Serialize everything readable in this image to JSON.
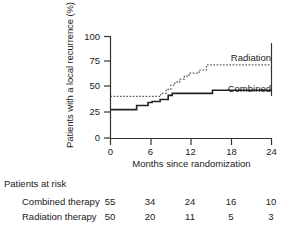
{
  "chart_data": {
    "type": "line",
    "subtype": "kaplan-meier-step",
    "title": "",
    "xlabel": "Months since randomization",
    "ylabel": "Patients with a local recurrence (%)",
    "xlim": [
      0,
      24
    ],
    "ylim": [
      0,
      100
    ],
    "xticks": [
      0,
      6,
      12,
      18,
      24
    ],
    "yticks": [
      0,
      25,
      50,
      75,
      100
    ],
    "xtick_labels": [
      "0",
      "6",
      "12",
      "18",
      "24"
    ],
    "ytick_labels": [
      "0",
      "25",
      "50",
      "75",
      "100"
    ],
    "grid": false,
    "legend_position": "inline-right",
    "series": [
      {
        "name": "Radiation",
        "label": "Radiation",
        "style": "dotted",
        "color": "#555555",
        "points": [
          [
            0,
            41
          ],
          [
            7.5,
            41
          ],
          [
            7.5,
            44
          ],
          [
            8.3,
            44
          ],
          [
            8.3,
            48
          ],
          [
            9.0,
            48
          ],
          [
            9.0,
            52
          ],
          [
            9.6,
            52
          ],
          [
            9.6,
            55
          ],
          [
            10.3,
            55
          ],
          [
            10.3,
            58
          ],
          [
            11.0,
            58
          ],
          [
            11.0,
            61
          ],
          [
            11.7,
            61
          ],
          [
            11.7,
            64
          ],
          [
            13.2,
            64
          ],
          [
            13.2,
            67
          ],
          [
            14.3,
            67
          ],
          [
            14.3,
            72
          ],
          [
            24,
            72
          ]
        ]
      },
      {
        "name": "Combined",
        "label": "Combined",
        "style": "solid",
        "color": "#222222",
        "points": [
          [
            0,
            28
          ],
          [
            3.9,
            28
          ],
          [
            3.9,
            32
          ],
          [
            5.6,
            32
          ],
          [
            5.6,
            35
          ],
          [
            6.2,
            35
          ],
          [
            6.2,
            36
          ],
          [
            7.4,
            36
          ],
          [
            7.4,
            38
          ],
          [
            8.6,
            38
          ],
          [
            8.6,
            42
          ],
          [
            9.2,
            42
          ],
          [
            9.2,
            44
          ],
          [
            15.2,
            44
          ],
          [
            15.2,
            47
          ],
          [
            24,
            47
          ]
        ]
      }
    ],
    "series_labels": [
      {
        "text": "Radiation",
        "x": 272,
        "y": 58
      },
      {
        "text": "Combined",
        "x": 272,
        "y": 89
      }
    ]
  },
  "risk_table": {
    "title": "Patients at risk",
    "column_x": [
      0,
      6,
      12,
      18,
      24
    ],
    "rows": [
      {
        "label": "Combined therapy",
        "values": [
          "55",
          "34",
          "24",
          "16",
          "10"
        ]
      },
      {
        "label": "Radiation therapy",
        "values": [
          "50",
          "20",
          "11",
          "5",
          "3"
        ]
      }
    ]
  }
}
